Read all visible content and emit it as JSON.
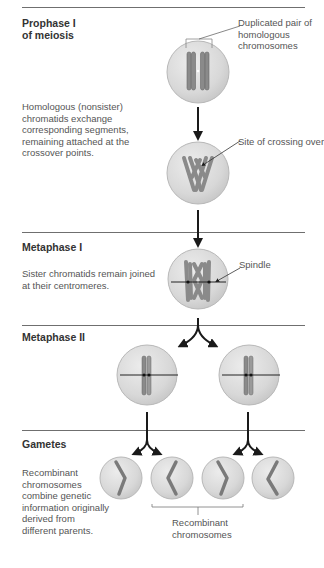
{
  "stages": [
    {
      "id": "prophase1",
      "title_line1": "Prophase I",
      "title_line2": "of meiosis",
      "description": [
        "Homologous (nonsister)",
        "chromatids exchange",
        "corresponding segments,",
        "remaining attached at the",
        "crossover points."
      ]
    },
    {
      "id": "metaphase1",
      "title": "Metaphase I",
      "description": [
        "Sister chromatids remain joined",
        "at their centromeres."
      ]
    },
    {
      "id": "metaphase2",
      "title": "Metaphase II"
    },
    {
      "id": "gametes",
      "title": "Gametes",
      "description": [
        "Recombinant",
        "chromosomes",
        "combine genetic",
        "information originally",
        "derived from",
        "different parents."
      ]
    }
  ],
  "callouts": {
    "homologous_pair": [
      "Duplicated pair of",
      "homologous",
      "chromosomes"
    ],
    "crossing_over": "Site of crossing over",
    "spindle": "Spindle",
    "recombinant": [
      "Recombinant",
      "chromosomes"
    ]
  },
  "colors": {
    "cell_fill": "#d9d9d9",
    "cell_edge": "#b8b8b8",
    "chromosome": "#8a8a8a",
    "chromosome_dark": "#6a6a6a",
    "arrow": "#1a1a1a",
    "rule": "#6f6f6f"
  }
}
